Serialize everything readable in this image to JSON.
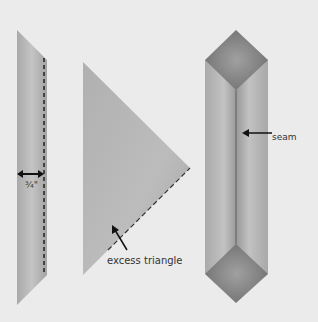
{
  "diagram": {
    "panels": [
      {
        "name": "strip-with-seam-allowance",
        "measurement_label": "¾\""
      },
      {
        "name": "folded-triangle",
        "annotation_label": "excess triangle"
      },
      {
        "name": "sewn-strip",
        "annotation_label": "seam"
      }
    ],
    "colors": {
      "background": "#ebebeb",
      "fabric": "#bdbdbd",
      "fabric_dark": "#8e8e8e",
      "line": "#222222"
    }
  }
}
